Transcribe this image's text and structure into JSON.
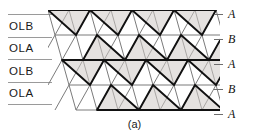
{
  "figure": {
    "caption": "(a)",
    "left_labels": [
      "OLB",
      "OLA",
      "OLB",
      "OLA"
    ],
    "right_labels": [
      "A",
      "B",
      "A",
      "B",
      "A"
    ],
    "colors": {
      "ink": "#111111",
      "rule": "#9a9a9a",
      "thin_line": "#7b7b7b",
      "thick_line": "#111111",
      "shade": "#cfcbc6",
      "background": "#ffffff"
    }
  },
  "chart_data": {
    "type": "diagram",
    "title": "(a)",
    "rows": 4,
    "columns": 8,
    "plane_sequence": [
      "A",
      "B",
      "A",
      "B",
      "A"
    ],
    "layer_sequence": [
      "OLB",
      "OLA",
      "OLB",
      "OLA"
    ],
    "cell_width": 21,
    "cell_height": 25,
    "row_shift": 7,
    "row_highlight_pattern": [
      [
        1,
        0,
        1,
        0,
        1,
        0,
        1,
        0
      ],
      [
        0,
        1,
        0,
        1,
        0,
        1,
        0,
        1
      ],
      [
        1,
        0,
        1,
        0,
        1,
        0,
        1,
        0
      ],
      [
        0,
        1,
        0,
        1,
        0,
        1,
        0,
        1
      ]
    ]
  }
}
